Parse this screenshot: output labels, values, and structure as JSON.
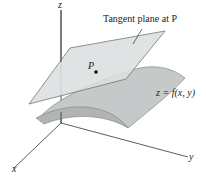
{
  "diagram": {
    "title_label": "Tangent plane at P",
    "point_label": "P",
    "surface_label": "z = f(x, y)",
    "axes": {
      "x": "x",
      "y": "y",
      "z": "z"
    },
    "colors": {
      "plane_fill": "#d9dcdc",
      "surface_fill": "#c4c7c7",
      "surface_shade": "#a9adad",
      "line": "#555555",
      "axis": "#333333"
    }
  }
}
